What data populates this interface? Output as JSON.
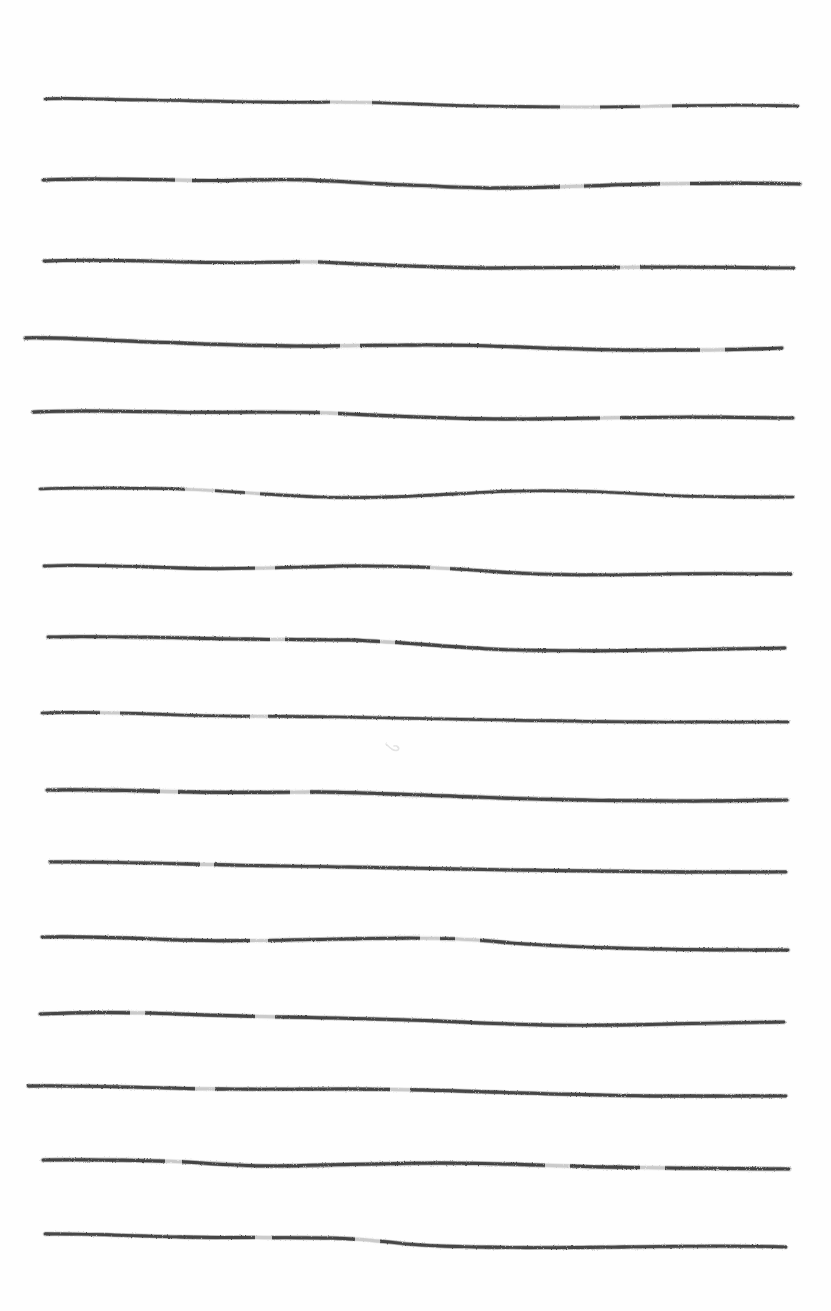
{
  "canvas": {
    "width": 831,
    "height": 1311,
    "background_color": "#fefefe",
    "description": "Sheet of white paper with hand-drawn horizontal ruled lines"
  },
  "artwork": {
    "title": "Hand-drawn horizontal ruled lines",
    "medium": "pencil on paper",
    "line_count": 16,
    "ink_color": "#3f3f3f",
    "ink_color_light": "#6e6e6e",
    "average_line_spacing": 76,
    "left_margin": 42,
    "right_margin": 793
  },
  "lines": [
    {
      "id": "line-1",
      "index": 1,
      "y_left": 99,
      "y_right": 106,
      "x_start": 45,
      "x_end": 798,
      "stroke_width": 2.6,
      "opacity": 0.92,
      "path": "M45,99 C70,97 110,100 150,100 C210,101 270,103 330,102 C380,102 430,105 480,106 C540,107 600,108 660,106 C720,105 760,105 798,106",
      "breaks": [
        [
          330,
          372
        ],
        [
          560,
          600
        ],
        [
          640,
          672
        ]
      ]
    },
    {
      "id": "line-2",
      "index": 2,
      "y_left": 180,
      "y_right": 184,
      "x_start": 43,
      "x_end": 800,
      "stroke_width": 3.0,
      "opacity": 0.95,
      "path": "M43,180 C80,178 130,179 180,180 C230,182 270,178 310,180 C370,183 430,187 490,188 C550,188 600,185 650,184 C710,183 760,183 800,184",
      "breaks": [
        [
          175,
          192
        ],
        [
          560,
          584
        ],
        [
          660,
          690
        ]
      ]
    },
    {
      "id": "line-3",
      "index": 3,
      "y_left": 261,
      "y_right": 268,
      "x_start": 44,
      "x_end": 794,
      "stroke_width": 2.8,
      "opacity": 0.93,
      "path": "M44,261 C90,259 140,261 190,262 C240,264 280,261 320,262 C380,265 440,268 500,268 C560,268 620,267 680,267 C730,267 770,268 794,268",
      "breaks": [
        [
          300,
          318
        ],
        [
          620,
          640
        ]
      ]
    },
    {
      "id": "line-4",
      "index": 4,
      "y_left": 338,
      "y_right": 349,
      "x_start": 25,
      "x_end": 782,
      "stroke_width": 3.0,
      "opacity": 0.94,
      "path": "M25,338 C60,337 100,340 150,342 C210,344 270,347 330,346 C390,345 440,344 490,346 C550,348 610,351 670,350 C720,350 760,349 782,348",
      "breaks": [
        [
          340,
          360
        ],
        [
          700,
          725
        ]
      ]
    },
    {
      "id": "line-5",
      "index": 5,
      "y_left": 412,
      "y_right": 418,
      "x_start": 33,
      "x_end": 793,
      "stroke_width": 2.9,
      "opacity": 0.94,
      "path": "M33,412 C70,410 120,411 170,412 C230,413 280,411 330,413 C390,416 450,419 510,419 C570,419 630,417 690,417 C740,417 775,418 793,418",
      "breaks": [
        [
          320,
          338
        ],
        [
          600,
          620
        ]
      ]
    },
    {
      "id": "line-6",
      "index": 6,
      "y_left": 489,
      "y_right": 497,
      "x_start": 40,
      "x_end": 793,
      "stroke_width": 2.7,
      "opacity": 0.93,
      "path": "M40,489 C80,487 130,488 180,489 C230,491 270,495 320,497 C380,499 430,495 490,492 C550,489 600,491 660,495 C720,498 770,497 793,497",
      "breaks": [
        [
          185,
          215
        ],
        [
          245,
          260
        ]
      ]
    },
    {
      "id": "line-7",
      "index": 7,
      "y_left": 566,
      "y_right": 574,
      "x_start": 44,
      "x_end": 791,
      "stroke_width": 2.8,
      "opacity": 0.94,
      "path": "M44,566 C80,564 130,566 180,568 C240,570 290,567 340,566 C400,565 450,568 500,572 C560,576 610,575 670,574 C720,573 770,574 791,574",
      "breaks": [
        [
          255,
          275
        ],
        [
          430,
          450
        ]
      ]
    },
    {
      "id": "line-8",
      "index": 8,
      "y_left": 637,
      "y_right": 648,
      "x_start": 48,
      "x_end": 785,
      "stroke_width": 2.9,
      "opacity": 0.95,
      "path": "M48,637 C90,636 140,637 190,638 C250,640 300,639 350,640 C400,642 440,646 490,649 C550,652 610,651 670,650 C720,649 765,648 785,648",
      "breaks": [
        [
          270,
          285
        ],
        [
          380,
          395
        ]
      ]
    },
    {
      "id": "line-9",
      "index": 9,
      "y_left": 713,
      "y_right": 722,
      "x_start": 42,
      "x_end": 788,
      "stroke_width": 2.7,
      "opacity": 0.93,
      "path": "M42,713 C80,711 130,713 180,715 C240,717 290,716 340,717 C400,718 450,719 500,720 C560,721 620,722 680,722 C730,722 770,722 788,722",
      "breaks": [
        [
          100,
          120
        ],
        [
          250,
          268
        ]
      ]
    },
    {
      "id": "line-10",
      "index": 10,
      "y_left": 790,
      "y_right": 800,
      "x_start": 47,
      "x_end": 787,
      "stroke_width": 3.1,
      "opacity": 0.95,
      "path": "M47,790 C90,789 140,791 190,792 C240,793 280,792 320,792 C380,793 440,796 500,798 C560,800 620,801 680,801 C730,801 770,800 787,800",
      "breaks": [
        [
          160,
          178
        ],
        [
          290,
          310
        ]
      ]
    },
    {
      "id": "line-11",
      "index": 11,
      "y_left": 862,
      "y_right": 872,
      "x_start": 50,
      "x_end": 786,
      "stroke_width": 2.8,
      "opacity": 0.93,
      "path": "M50,862 C90,861 140,863 190,864 C250,866 300,866 350,867 C410,868 460,869 510,870 C570,871 620,871 680,872 C730,872 770,872 786,872",
      "breaks": [
        [
          200,
          214
        ]
      ]
    },
    {
      "id": "line-12",
      "index": 12,
      "y_left": 937,
      "y_right": 950,
      "x_start": 42,
      "x_end": 788,
      "stroke_width": 2.9,
      "opacity": 0.95,
      "path": "M42,937 C80,936 130,938 180,940 C240,942 290,940 340,939 C390,938 440,937 490,941 C540,946 600,948 660,949 C710,950 765,950 788,950",
      "breaks": [
        [
          250,
          268
        ],
        [
          420,
          440
        ],
        [
          455,
          480
        ]
      ]
    },
    {
      "id": "line-13",
      "index": 13,
      "y_left": 1014,
      "y_right": 1022,
      "x_start": 40,
      "x_end": 784,
      "stroke_width": 2.9,
      "opacity": 0.94,
      "path": "M40,1014 C80,1012 110,1012 150,1013 C200,1015 240,1016 280,1017 C340,1018 400,1019 460,1022 C520,1025 570,1026 620,1025 C680,1024 750,1022 784,1022",
      "breaks": [
        [
          130,
          145
        ],
        [
          255,
          275
        ]
      ]
    },
    {
      "id": "line-14",
      "index": 14,
      "y_left": 1086,
      "y_right": 1096,
      "x_start": 28,
      "x_end": 786,
      "stroke_width": 2.8,
      "opacity": 0.93,
      "path": "M28,1086 C70,1085 120,1087 170,1088 C230,1090 280,1089 330,1089 C390,1089 440,1090 490,1092 C550,1094 610,1096 670,1096 C730,1096 770,1096 786,1096",
      "breaks": [
        [
          195,
          215
        ],
        [
          390,
          410
        ]
      ]
    },
    {
      "id": "line-15",
      "index": 15,
      "y_left": 1160,
      "y_right": 1169,
      "x_start": 43,
      "x_end": 789,
      "stroke_width": 3.0,
      "opacity": 0.95,
      "path": "M43,1160 C80,1159 120,1160 160,1161 C200,1162 230,1166 270,1166 C320,1166 380,1163 440,1163 C500,1163 550,1166 600,1167 C660,1168 740,1169 789,1169",
      "breaks": [
        [
          165,
          182
        ],
        [
          545,
          570
        ],
        [
          640,
          665
        ]
      ]
    },
    {
      "id": "line-16",
      "index": 16,
      "y_left": 1234,
      "y_right": 1247,
      "x_start": 45,
      "x_end": 786,
      "stroke_width": 2.8,
      "opacity": 0.93,
      "path": "M45,1234 C80,1233 130,1236 180,1237 C230,1238 280,1237 330,1238 C380,1239 400,1245 440,1246 C500,1248 560,1248 620,1247 C690,1246 755,1246 786,1247",
      "breaks": [
        [
          255,
          272
        ],
        [
          355,
          380
        ]
      ]
    }
  ],
  "marks": [
    {
      "id": "smudge-1",
      "name": "faint-pencil-smudge",
      "x": 391,
      "y": 748,
      "width": 14,
      "height": 10,
      "opacity": 0.18,
      "path": "M386,744 C390,748 394,752 398,750 C400,748 397,745 394,746"
    }
  ]
}
